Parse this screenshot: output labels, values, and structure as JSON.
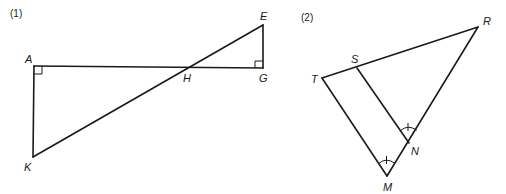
{
  "figures": [
    {
      "number_label": "(1)",
      "points": {
        "A": {
          "label": "A",
          "x": 34,
          "y": 66
        },
        "K": {
          "label": "K",
          "x": 33,
          "y": 157
        },
        "H": {
          "label": "H",
          "x": 187,
          "y": 67
        },
        "G": {
          "label": "G",
          "x": 263,
          "y": 68
        },
        "E": {
          "label": "E",
          "x": 263,
          "y": 25
        }
      },
      "segments": [
        "AG",
        "AK",
        "KE",
        "EG"
      ],
      "right_angles": [
        "A",
        "G"
      ]
    },
    {
      "number_label": "(2)",
      "points": {
        "T": {
          "label": "T",
          "x": 322,
          "y": 78
        },
        "S": {
          "label": "S",
          "x": 357,
          "y": 68
        },
        "R": {
          "label": "R",
          "x": 478,
          "y": 27
        },
        "N": {
          "label": "N",
          "x": 409,
          "y": 143
        },
        "M": {
          "label": "M",
          "x": 387,
          "y": 176
        }
      },
      "segments": [
        "TR",
        "RM",
        "MT",
        "SN"
      ],
      "congruent_angles": [
        "SNR",
        "TMN"
      ]
    }
  ]
}
